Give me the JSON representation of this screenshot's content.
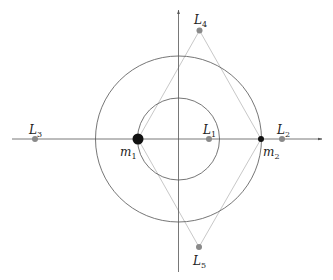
{
  "diagram": {
    "type": "lagrange-points",
    "colors": {
      "axis": "#555555",
      "circle": "#666666",
      "triangle": "#c8c8c8",
      "mass": "#111111",
      "lagrange_point": "#8a8a8a",
      "text": "#222222"
    },
    "axes": {
      "origin": [
        178.5,
        139
      ],
      "x_axis": {
        "from": [
          12,
          139
        ],
        "to": [
          322,
          139
        ],
        "arrow": true
      },
      "y_axis": {
        "from": [
          178.5,
          272
        ],
        "to": [
          178.5,
          10
        ],
        "arrow": true
      }
    },
    "circles": [
      {
        "name": "outer-orbit",
        "cx": 178.5,
        "cy": 139,
        "r": 83
      },
      {
        "name": "inner-orbit",
        "cx": 178.5,
        "cy": 139,
        "r": 41
      }
    ],
    "masses": [
      {
        "id": "m1",
        "letter": "m",
        "sub": "1",
        "x": 138,
        "y": 139,
        "r": 5.5,
        "label_x": 120,
        "label_y": 156
      },
      {
        "id": "m2",
        "letter": "m",
        "sub": "2",
        "x": 261,
        "y": 139,
        "r": 3,
        "label_x": 263,
        "label_y": 156
      }
    ],
    "lagrange_points": [
      {
        "id": "L1",
        "letter": "L",
        "sub": "1",
        "x": 209,
        "y": 139,
        "label_x": 203,
        "label_y": 134
      },
      {
        "id": "L2",
        "letter": "L",
        "sub": "2",
        "x": 282,
        "y": 139,
        "label_x": 277,
        "label_y": 134
      },
      {
        "id": "L3",
        "letter": "L",
        "sub": "3",
        "x": 35,
        "y": 139,
        "label_x": 29,
        "label_y": 134
      },
      {
        "id": "L4",
        "letter": "L",
        "sub": "4",
        "x": 199.5,
        "y": 30.5,
        "label_x": 194,
        "label_y": 24
      },
      {
        "id": "L5",
        "letter": "L",
        "sub": "5",
        "x": 199,
        "y": 247,
        "label_x": 193,
        "label_y": 265
      }
    ],
    "triangle_lines": [
      {
        "from": "L4",
        "to": "m1"
      },
      {
        "from": "L4",
        "to": "m2"
      },
      {
        "from": "L5",
        "to": "m1"
      },
      {
        "from": "L5",
        "to": "m2"
      }
    ]
  }
}
